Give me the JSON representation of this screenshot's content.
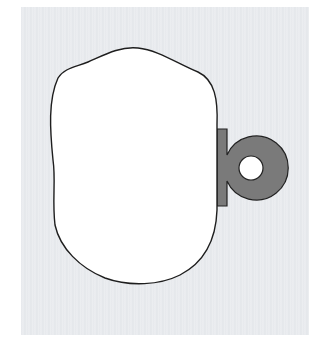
{
  "figure": {
    "colors": {
      "background_panel": "#e8eaee",
      "blob_fill": "#ffffff",
      "blob_stroke": "#222222",
      "tab_fill": "#7a7a7a",
      "tab_stroke": "#222222",
      "ring_hole": "#ffffff"
    },
    "shapes": [
      {
        "name": "blob",
        "kind": "closed-curve"
      },
      {
        "name": "tab",
        "kind": "rectangle-with-ring"
      }
    ]
  }
}
